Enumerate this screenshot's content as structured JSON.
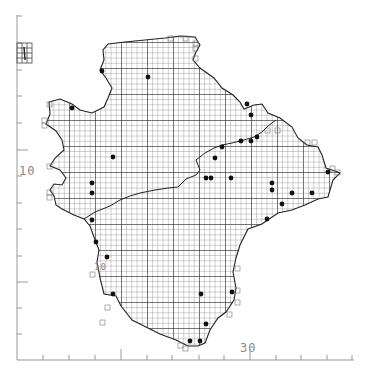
{
  "map": {
    "type": "grid distribution map",
    "grid_cell_px": 5.2,
    "major_grid_px": 26,
    "colors": {
      "ink": "#222222",
      "grid": "#555555",
      "axis": "#999999",
      "label": "#888888",
      "background": "#ffffff"
    },
    "axis_labels": {
      "left": "10",
      "bottom": "30",
      "inset": "10"
    },
    "inset_box_label": "4",
    "left_axis_ticks_y": [
      16,
      43,
      70,
      96,
      123,
      150,
      176,
      203,
      229,
      256,
      282,
      308,
      334
    ],
    "bottom_axis_ticks_x": [
      43,
      69,
      95,
      121,
      147,
      172,
      199,
      224,
      250,
      276,
      301,
      327,
      352
    ],
    "records": [
      [
        102,
        71
      ],
      [
        148,
        77
      ],
      [
        72,
        108
      ],
      [
        247,
        104
      ],
      [
        251,
        115
      ],
      [
        257,
        137
      ],
      [
        241,
        141
      ],
      [
        251,
        141
      ],
      [
        222,
        147
      ],
      [
        215,
        158
      ],
      [
        113,
        157
      ],
      [
        92,
        183
      ],
      [
        92,
        193
      ],
      [
        206,
        178
      ],
      [
        211,
        178
      ],
      [
        231,
        178
      ],
      [
        272,
        183
      ],
      [
        272,
        190
      ],
      [
        328,
        172
      ],
      [
        292,
        193
      ],
      [
        312,
        193
      ],
      [
        282,
        204
      ],
      [
        267,
        219
      ],
      [
        92,
        220
      ],
      [
        93,
        221
      ],
      [
        96,
        242
      ],
      [
        107,
        257
      ],
      [
        113,
        294
      ],
      [
        201,
        294
      ],
      [
        232,
        292
      ],
      [
        206,
        324
      ],
      [
        190,
        341
      ],
      [
        200,
        341
      ]
    ]
  }
}
